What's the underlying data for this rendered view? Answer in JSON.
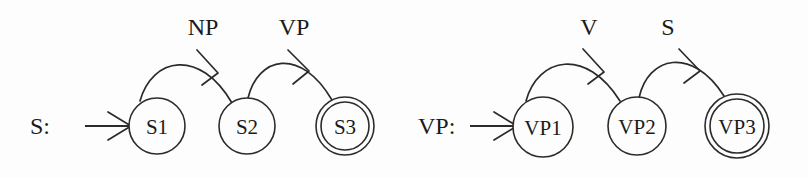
{
  "figure": {
    "background_color": "#fdfdfd",
    "stroke_color": "#2b2b2b",
    "text_color": "#1a1a1a",
    "caption": ""
  },
  "machines": [
    {
      "id": "s-machine",
      "label": "S:",
      "label_x": 30,
      "label_y": 126,
      "start_arrow": {
        "x1": 85,
        "y1": 126,
        "x2": 130,
        "y2": 126
      },
      "states": [
        {
          "id": "s1",
          "label": "S1",
          "cx": 157,
          "cy": 126,
          "r": 28,
          "accepting": false
        },
        {
          "id": "s2",
          "label": "S2",
          "cx": 247,
          "cy": 126,
          "r": 28,
          "accepting": false
        },
        {
          "id": "s3",
          "label": "S3",
          "cx": 345,
          "cy": 126,
          "r": 29,
          "accepting": true
        }
      ],
      "transitions": [
        {
          "id": "s1-s2",
          "label": "NP",
          "from": "s1",
          "to": "s2",
          "label_x": 203,
          "label_y": 27,
          "path": "M 140 101 C 152 57, 200 48, 232 103",
          "arrow": "M 197 50 L 218 73 M 202 85 L 218 73"
        },
        {
          "id": "s2-s3",
          "label": "VP",
          "from": "s2",
          "to": "s3",
          "label_x": 294,
          "label_y": 27,
          "path": "M 248 98 C 258 57, 300 46, 332 100",
          "arrow": "M 288 50 L 309 71 M 293 84 L 309 71"
        }
      ]
    },
    {
      "id": "vp-machine",
      "label": "VP:",
      "label_x": 418,
      "label_y": 126,
      "start_arrow": {
        "x1": 470,
        "y1": 126,
        "x2": 516,
        "y2": 126
      },
      "states": [
        {
          "id": "vp1",
          "label": "VP1",
          "cx": 543,
          "cy": 127,
          "r": 30,
          "accepting": false
        },
        {
          "id": "vp2",
          "label": "VP2",
          "cx": 637,
          "cy": 126,
          "r": 29,
          "accepting": false
        },
        {
          "id": "vp3",
          "label": "VP3",
          "cx": 737,
          "cy": 126,
          "r": 32,
          "accepting": true
        }
      ],
      "transitions": [
        {
          "id": "vp1-vp2",
          "label": "V",
          "from": "vp1",
          "to": "vp2",
          "label_x": 589,
          "label_y": 27,
          "path": "M 526 101 C 538 57, 586 47, 620 101",
          "arrow": "M 583 49 L 604 72 M 588 84 L 604 72"
        },
        {
          "id": "vp2-vp3",
          "label": "S",
          "from": "vp2",
          "to": "vp3",
          "label_x": 668,
          "label_y": 27,
          "path": "M 639 98 C 648 56, 692 46, 724 96",
          "arrow": "M 679 49 L 700 71 M 684 83 L 700 71"
        }
      ]
    }
  ]
}
